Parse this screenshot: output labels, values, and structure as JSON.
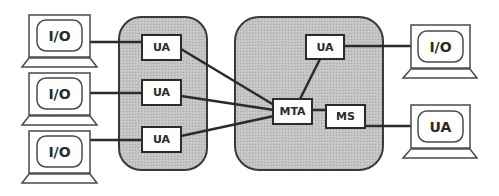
{
  "diagram": {
    "colors": {
      "line": "#2b2b2b",
      "group_fill": "#bdbdbd",
      "box_fill": "#ffffff",
      "terminal_stroke": "#4a4a4a"
    },
    "left_terminals": [
      {
        "label": "I/O"
      },
      {
        "label": "I/O"
      },
      {
        "label": "I/O"
      }
    ],
    "left_group": {
      "agents": [
        {
          "label": "UA"
        },
        {
          "label": "UA"
        },
        {
          "label": "UA"
        }
      ]
    },
    "right_group": {
      "ua": {
        "label": "UA"
      },
      "mta": {
        "label": "MTA"
      },
      "ms": {
        "label": "MS"
      }
    },
    "right_terminals": [
      {
        "label": "I/O"
      },
      {
        "label": "UA"
      }
    ]
  }
}
